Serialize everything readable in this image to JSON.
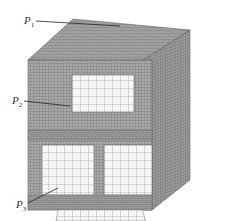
{
  "figure": {
    "labels": [
      {
        "id": "P1",
        "text": "P",
        "sub": "1"
      },
      {
        "id": "P2",
        "text": "P",
        "sub": "2"
      },
      {
        "id": "P3",
        "text": "P",
        "sub": "3"
      }
    ]
  },
  "colors": {
    "mesh_dark": "#7a7a7a",
    "mesh_mid": "#9a9a9a",
    "mesh_light": "#b5b5b5",
    "opening": "#f4f4f4",
    "leader": "#222222"
  }
}
